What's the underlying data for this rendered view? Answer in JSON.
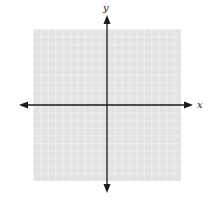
{
  "figure": {
    "type": "coordinate-plane",
    "grid": {
      "cells_x": 20,
      "cells_y": 20,
      "fill": "#e4e4e4",
      "line_color": "#f7f7f7"
    },
    "axes": {
      "color": "#1a1a1a",
      "x_label": "x",
      "y_label": "y"
    }
  }
}
